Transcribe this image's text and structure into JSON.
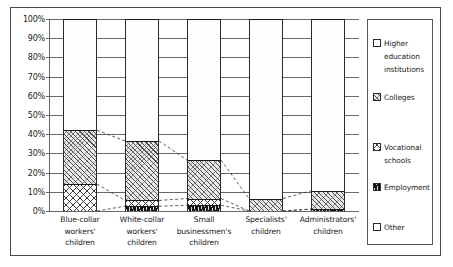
{
  "chart_data": {
    "type": "bar",
    "stacked": true,
    "stack_mode": "percent",
    "title": "",
    "xlabel": "",
    "ylabel": "",
    "ylim": [
      0,
      100
    ],
    "yticks": [
      "0%",
      "10%",
      "20%",
      "30%",
      "40%",
      "50%",
      "60%",
      "70%",
      "80%",
      "90%",
      "100%"
    ],
    "grid": true,
    "legend_position": "right",
    "categories": [
      "Blue-collar workers' children",
      "White-collar workers' children",
      "Small businessmen's children",
      "Specialists' children",
      "Administrators' children"
    ],
    "category_lines": [
      [
        "Blue-collar",
        "workers'",
        "children"
      ],
      [
        "White-collar",
        "workers'",
        "children"
      ],
      [
        "Small",
        "businessmen's",
        "children"
      ],
      [
        "Specialists'",
        "children"
      ],
      [
        "Administrators'",
        "children"
      ]
    ],
    "series": [
      {
        "name": "Other",
        "pattern": "white",
        "values": [
          0,
          0,
          0,
          0,
          0
        ]
      },
      {
        "name": "Employment",
        "pattern": "black",
        "values": [
          0,
          2.5,
          3,
          0,
          1
        ]
      },
      {
        "name": "Vocational schools",
        "pattern": "cross",
        "values": [
          14,
          3,
          3.5,
          0,
          0
        ]
      },
      {
        "name": "Colleges",
        "pattern": "hatch",
        "values": [
          28,
          31,
          20,
          6.5,
          9.5
        ]
      },
      {
        "name": "Higher education institutions",
        "pattern": "dots",
        "values": [
          58,
          63.5,
          73.5,
          93.5,
          89.5
        ]
      }
    ],
    "connector_style": "dashed"
  },
  "legend": {
    "items": [
      {
        "label": "Higher",
        "cont": [
          "education",
          "institutions"
        ],
        "pattern": "dots"
      },
      {
        "label": "Colleges",
        "cont": [],
        "pattern": "hatch"
      },
      {
        "label": "Vocational",
        "cont": [
          "schools"
        ],
        "pattern": "cross"
      },
      {
        "label": "Employment",
        "cont": [],
        "pattern": "black"
      },
      {
        "label": "Other",
        "cont": [],
        "pattern": "white"
      }
    ]
  }
}
